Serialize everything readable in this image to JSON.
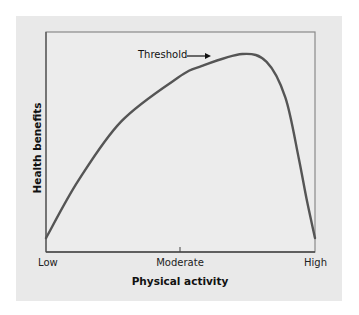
{
  "chart_data": {
    "type": "line",
    "title": "",
    "xlabel": "Physical activity",
    "ylabel": "Health benefits",
    "x_tick_labels": [
      "Low",
      "Moderate",
      "High"
    ],
    "x_tick_positions": [
      0,
      0.5,
      1
    ],
    "grid": false,
    "legend": null,
    "axis_ranges": {
      "x": [
        0,
        1
      ],
      "y": [
        0,
        1
      ]
    },
    "series": [
      {
        "name": "Health benefits curve",
        "x": [
          0.0,
          0.12,
          0.28,
          0.49,
          0.58,
          0.73,
          0.82,
          0.89,
          0.94,
          0.97,
          1.0
        ],
        "y": [
          0.07,
          0.36,
          0.66,
          0.88,
          0.94,
          1.0,
          0.96,
          0.78,
          0.47,
          0.26,
          0.07
        ]
      }
    ],
    "annotations": [
      {
        "text": "Threshold",
        "arrow": "right",
        "points_to": "peak",
        "x": 0.73,
        "y": 1.0
      }
    ],
    "colors": {
      "line": "#555555",
      "axes": "#555555",
      "panel": "#e9e9e9"
    }
  },
  "labels": {
    "ylabel": "Health benefits",
    "xlabel": "Physical activity",
    "x_low": "Low",
    "x_moderate": "Moderate",
    "x_high": "High",
    "annotation": "Threshold"
  }
}
